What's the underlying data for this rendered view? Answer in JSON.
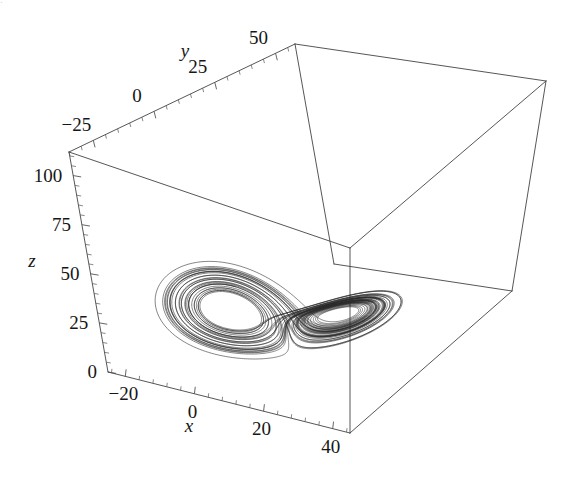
{
  "figure": {
    "kind": "lorenz-attractor-3d-phase-portrait",
    "background_color": "#ffffff",
    "line_color": "#2b2b2b",
    "frame_color": "#434343",
    "text_color": "#161616",
    "scan_artifact_text": "."
  },
  "chart_data": {
    "type": "line",
    "title": "",
    "subtitle": "",
    "plot3d": true,
    "xlabel": "x",
    "ylabel": "y",
    "zlabel": "z",
    "xlim": [
      -25,
      45
    ],
    "ylim": [
      -35,
      58
    ],
    "zlim": [
      0,
      112
    ],
    "grid": false,
    "legend": false,
    "legend_position": "none",
    "x_ticks": [
      -20,
      0,
      20,
      40
    ],
    "x_tick_labels": [
      "-20",
      "0",
      "20",
      "40"
    ],
    "y_ticks": [
      -25,
      0,
      25,
      50
    ],
    "y_tick_labels": [
      "-25",
      "0",
      "25",
      "50"
    ],
    "z_ticks": [
      0,
      25,
      50,
      75,
      100
    ],
    "z_tick_labels": [
      "0",
      "25",
      "50",
      "75",
      "100"
    ],
    "minor_ticks_per_interval": 4,
    "series": [
      {
        "name": "Lorenz trajectory",
        "equations": [
          "dx/dt = sigma*(y - x)",
          "dy/dt = x*(rho - z) - y",
          "dz/dt = x*y - beta*z"
        ],
        "parameters": {
          "sigma": 10,
          "rho": 28,
          "beta": 2.6666666667
        },
        "initial_conditions": {
          "x": 12.0,
          "y": 4.0,
          "z": 38.0
        },
        "integration": {
          "dt": 0.004,
          "steps": 13000,
          "method": "rk4"
        }
      }
    ]
  },
  "projection": {
    "note": "screen-space corners of the bounding box, in pixels",
    "corner_back_top": [
      295,
      44
    ],
    "corner_left_top": [
      69,
      152
    ],
    "corner_right_top": [
      546,
      81
    ],
    "corner_front_top": [
      350,
      248
    ],
    "corner_left_bottom": [
      108,
      372
    ],
    "corner_right_bottom": [
      512,
      291
    ],
    "corner_front_bottom": [
      350,
      433
    ]
  },
  "axis_labels": {
    "x": "x",
    "y": "y",
    "z": "z"
  },
  "tick_text": {
    "x": [
      "−20",
      "0",
      "20",
      "40"
    ],
    "y": [
      "−25",
      "0",
      "25",
      "50"
    ],
    "z": [
      "0",
      "25",
      "50",
      "75",
      "100"
    ]
  }
}
